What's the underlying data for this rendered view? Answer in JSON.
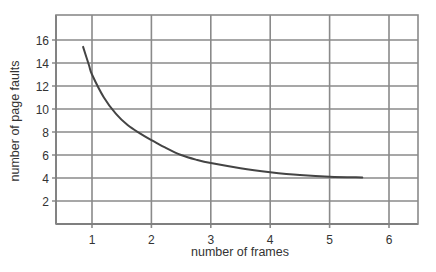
{
  "chart_data": {
    "type": "line",
    "title": "",
    "xlabel": "number of frames",
    "ylabel": "number of page faults",
    "xlim": [
      0.4,
      6.5
    ],
    "ylim": [
      0,
      18
    ],
    "x_ticks": [
      1,
      2,
      3,
      4,
      5,
      6
    ],
    "y_ticks": [
      2,
      4,
      6,
      8,
      10,
      12,
      14,
      16
    ],
    "x_tick_labels": [
      "1",
      "2",
      "3",
      "4",
      "5",
      "6"
    ],
    "y_tick_labels": [
      "2",
      "4",
      "6",
      "8",
      "10",
      "12",
      "14",
      "16"
    ],
    "grid": true,
    "legend": null,
    "series": [
      {
        "name": "page faults",
        "color": "#444444",
        "x": [
          0.85,
          0.95,
          1.0,
          1.2,
          1.4,
          1.6,
          1.8,
          2.0,
          2.25,
          2.5,
          2.75,
          3.0,
          3.5,
          4.0,
          4.5,
          5.0,
          5.55
        ],
        "y": [
          15.4,
          13.8,
          13.0,
          11.0,
          9.6,
          8.6,
          7.9,
          7.3,
          6.6,
          6.0,
          5.6,
          5.3,
          4.85,
          4.5,
          4.25,
          4.1,
          4.05
        ]
      }
    ]
  },
  "colors": {
    "grid": "#8a8a8a",
    "frame": "#555555",
    "curve": "#444444",
    "text": "#333333"
  }
}
